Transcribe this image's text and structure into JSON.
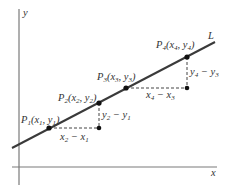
{
  "diagram": {
    "axes": {
      "x_label": "x",
      "y_label": "y",
      "color": "#7a7a7a"
    },
    "line": {
      "label": "L",
      "color": "#3a3a3a"
    },
    "points": [
      {
        "name": "P",
        "sub": "1",
        "xs": "x",
        "xsub": "1",
        "ys": "y",
        "ysub": "1",
        "label": "P1(x1, y1)"
      },
      {
        "name": "P",
        "sub": "2",
        "xs": "x",
        "xsub": "2",
        "ys": "y",
        "ysub": "2",
        "label": "P2(x2, y2)"
      },
      {
        "name": "P",
        "sub": "3",
        "xs": "x",
        "xsub": "3",
        "ys": "y",
        "ysub": "3",
        "label": "P3(x3, y3)"
      },
      {
        "name": "P",
        "sub": "4",
        "xs": "x",
        "xsub": "4",
        "ys": "y",
        "ysub": "4",
        "label": "P4(x4, y4)"
      }
    ],
    "differences": {
      "run_12": {
        "a": "x",
        "asub": "2",
        "b": "x",
        "bsub": "1",
        "label": "x2 − x1"
      },
      "rise_12": {
        "a": "y",
        "asub": "2",
        "b": "y",
        "bsub": "1",
        "label": "y2 − y1"
      },
      "run_34": {
        "a": "x",
        "asub": "4",
        "b": "x",
        "bsub": "3",
        "label": "x4 − x3"
      },
      "rise_34": {
        "a": "y",
        "asub": "4",
        "b": "y",
        "bsub": "3",
        "label": "y4 − y3"
      }
    },
    "minus": "−",
    "open_paren": "(",
    "comma": ", ",
    "close_paren": ")"
  }
}
